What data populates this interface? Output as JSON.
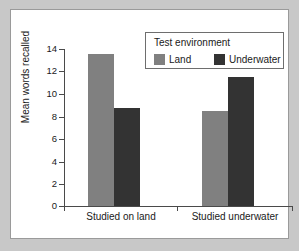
{
  "chart_data": {
    "type": "bar",
    "title": "",
    "xlabel": "",
    "ylabel": "Mean words recalled",
    "categories": [
      "Studied on land",
      "Studied underwater"
    ],
    "series": [
      {
        "name": "Land",
        "color": "#808080",
        "values": [
          13.6,
          8.5
        ]
      },
      {
        "name": "Underwater",
        "color": "#333333",
        "values": [
          8.7,
          11.5
        ]
      }
    ],
    "ylim": [
      0,
      14
    ],
    "yticks": [
      0,
      2,
      4,
      6,
      8,
      10,
      12,
      14
    ],
    "ytick_labels": [
      "0",
      "2",
      "4",
      "6",
      "8",
      "10",
      "12",
      "14"
    ],
    "grid": false,
    "legend": {
      "title": "Test environment",
      "position": "top-right",
      "entries": [
        {
          "label": "Land",
          "color": "#808080"
        },
        {
          "label": "Underwater",
          "color": "#333333"
        }
      ]
    }
  },
  "colors": {
    "page_background": "#c8c8c8",
    "panel_background": "#ffffff",
    "axis": "#4a4a4a",
    "text": "#1a1a1a",
    "legend_border": "#6e6e6e",
    "panel_border": "#9a9a9a"
  }
}
